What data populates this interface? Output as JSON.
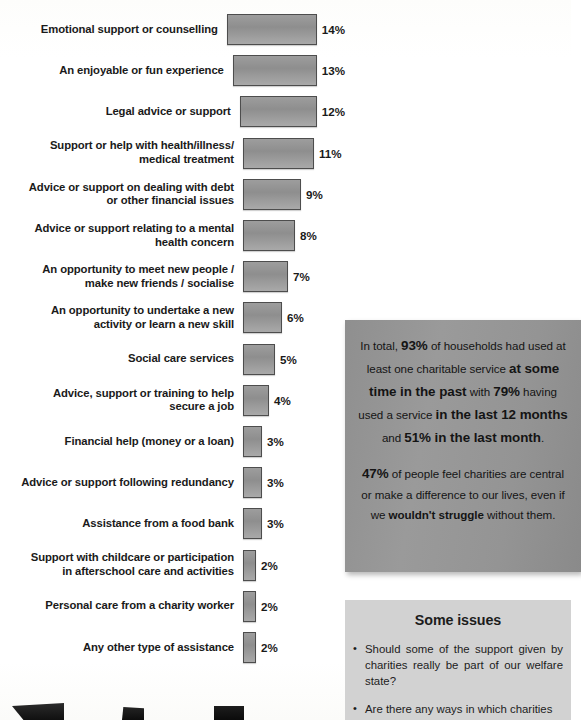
{
  "chart_data": {
    "type": "bar",
    "orientation": "horizontal",
    "title": "",
    "xlabel": "",
    "ylabel": "",
    "grid": false,
    "legend": "none",
    "xlim": [
      0,
      14
    ],
    "categories": [
      "Emotional support or counselling",
      "An enjoyable or fun experience",
      "Legal advice or support",
      "Support or help with health/illness/\nmedical treatment",
      "Advice or support on dealing with debt\nor other financial issues",
      "Advice or support relating to a mental\nhealth concern",
      "An opportunity to meet new people /\nmake new friends / socialise",
      "An opportunity to undertake a new\nactivity or learn a new skill",
      "Social care services",
      "Advice, support or training to help\nsecure a job",
      "Financial help (money or a loan)",
      "Advice or support following redundancy",
      "Assistance from a food bank",
      "Support with childcare or participation\nin afterschool care and activities",
      "Personal care from a charity worker",
      "Any other type of assistance"
    ],
    "values": [
      14,
      13,
      12,
      11,
      9,
      8,
      7,
      6,
      5,
      4,
      3,
      3,
      3,
      2,
      2,
      2
    ],
    "value_labels": [
      "14%",
      "13%",
      "12%",
      "11%",
      "9%",
      "8%",
      "7%",
      "6%",
      "5%",
      "4%",
      "3%",
      "3%",
      "3%",
      "2%",
      "2%",
      "2%"
    ],
    "bar_color": "#949494",
    "bar_border_color": "#4d4d4d"
  },
  "stat_callout": {
    "line1_a": "In total, ",
    "line1_pct": "93%",
    "line1_b": " of households had",
    "line2": "used at least one charitable service",
    "line3_strong": "at some time in the past",
    "line3_tail": " with",
    "line4_pct": "79%",
    "line4_tail": " having used a service",
    "line5_strong": "in the last 12 months",
    "line5_tail": " and",
    "line6_pct": "51%",
    "line6_strong": " in the last month",
    "line6_tail": ".",
    "para2_pct": "47%",
    "para2_a": " of people feel charities are",
    "para2_b": "central or make a difference to our",
    "para2_c": "lives, even if we ",
    "para2_strong": "wouldn't struggle",
    "para2_d": "without them.",
    "background_color": "#949494"
  },
  "issues_panel": {
    "title": "Some issues",
    "bullet_glyph": "•",
    "items": [
      "Should some of the support given by charities really be part of our welfare state?",
      "Are there any ways in which charities are a"
    ],
    "background_color": "#d2d2d2"
  }
}
